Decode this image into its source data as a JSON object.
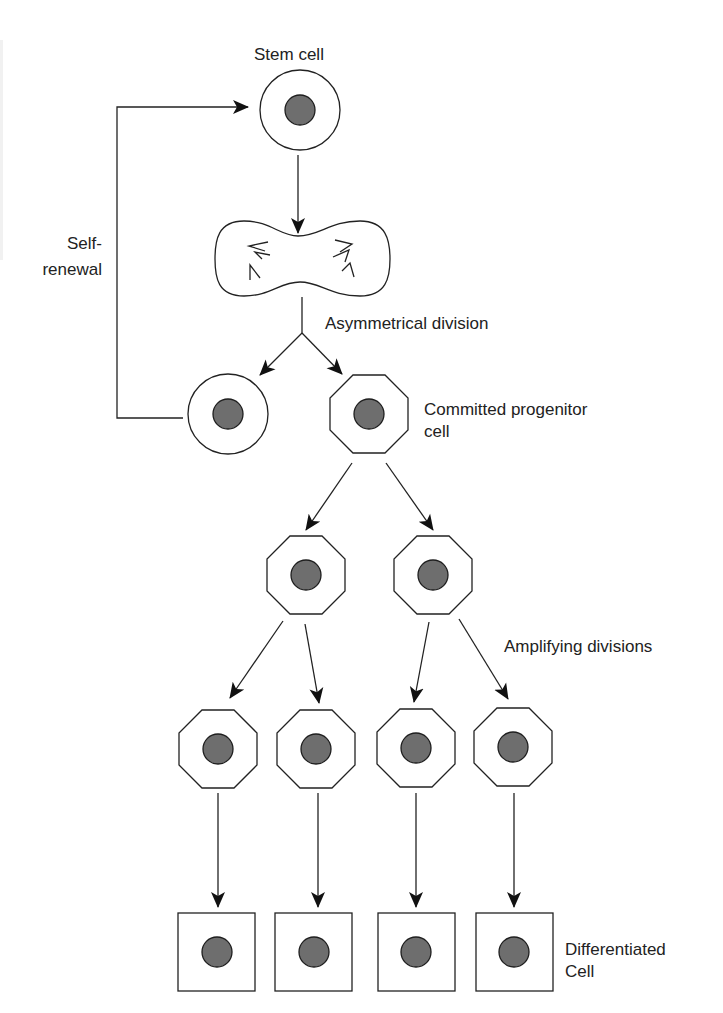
{
  "diagram": {
    "colors": {
      "stroke": "#222222",
      "nucleus_fill": "#6e6e6e",
      "nucleus_stroke": "#1e1e1e",
      "text": "#222222",
      "background": "#ffffff"
    },
    "labels": {
      "stem_cell": "Stem cell",
      "self_renewal_line1": "Self-",
      "self_renewal_line2": "renewal",
      "asymmetrical_division": "Asymmetrical division",
      "committed_line1": "Committed progenitor",
      "committed_line2": "cell",
      "amplifying_divisions": "Amplifying divisions",
      "differentiated_line1": "Differentiated",
      "differentiated_line2": "Cell"
    },
    "nodes": [
      {
        "id": "stem-cell",
        "shape": "circle",
        "cx": 300,
        "cy": 110
      },
      {
        "id": "dividing-cell",
        "shape": "dumbbell",
        "cx": 302,
        "cy": 258
      },
      {
        "id": "renewed-stem-cell",
        "shape": "circle",
        "cx": 228,
        "cy": 414
      },
      {
        "id": "committed-progenitor",
        "shape": "octagon",
        "cx": 369,
        "cy": 414
      },
      {
        "id": "progenitor-2a",
        "shape": "octagon",
        "cx": 306,
        "cy": 575
      },
      {
        "id": "progenitor-2b",
        "shape": "octagon",
        "cx": 433,
        "cy": 575
      },
      {
        "id": "progenitor-3a",
        "shape": "octagon",
        "cx": 218,
        "cy": 749
      },
      {
        "id": "progenitor-3b",
        "shape": "octagon",
        "cx": 316,
        "cy": 749
      },
      {
        "id": "progenitor-3c",
        "shape": "octagon",
        "cx": 416,
        "cy": 749
      },
      {
        "id": "progenitor-3d",
        "shape": "octagon",
        "cx": 513,
        "cy": 749
      },
      {
        "id": "differentiated-a",
        "shape": "square",
        "cx": 217,
        "cy": 952
      },
      {
        "id": "differentiated-b",
        "shape": "square",
        "cx": 314,
        "cy": 952
      },
      {
        "id": "differentiated-c",
        "shape": "square",
        "cx": 416,
        "cy": 952
      },
      {
        "id": "differentiated-d",
        "shape": "square",
        "cx": 514,
        "cy": 952
      }
    ],
    "edges": [
      {
        "from": "stem-cell",
        "to": "dividing-cell"
      },
      {
        "from": "dividing-cell",
        "to": "renewed-stem-cell"
      },
      {
        "from": "dividing-cell",
        "to": "committed-progenitor"
      },
      {
        "from": "renewed-stem-cell",
        "to": "stem-cell",
        "label": "Self-renewal"
      },
      {
        "from": "committed-progenitor",
        "to": "progenitor-2a"
      },
      {
        "from": "committed-progenitor",
        "to": "progenitor-2b"
      },
      {
        "from": "progenitor-2a",
        "to": "progenitor-3a"
      },
      {
        "from": "progenitor-2a",
        "to": "progenitor-3b"
      },
      {
        "from": "progenitor-2b",
        "to": "progenitor-3c"
      },
      {
        "from": "progenitor-2b",
        "to": "progenitor-3d"
      },
      {
        "from": "progenitor-3a",
        "to": "differentiated-a"
      },
      {
        "from": "progenitor-3b",
        "to": "differentiated-b"
      },
      {
        "from": "progenitor-3c",
        "to": "differentiated-c"
      },
      {
        "from": "progenitor-3d",
        "to": "differentiated-d"
      }
    ]
  }
}
